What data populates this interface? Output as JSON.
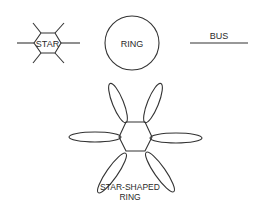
{
  "diagrams": {
    "star": {
      "label": "STAR",
      "spokes": 6
    },
    "ring": {
      "label": "RING"
    },
    "bus": {
      "label": "BUS"
    },
    "star_shaped_ring": {
      "label_line1": "STAR-SHAPED",
      "label_line2": "RING",
      "petals": 6
    }
  },
  "colors": {
    "stroke": "#333333",
    "text": "#2a2a2a",
    "background": "#ffffff"
  }
}
